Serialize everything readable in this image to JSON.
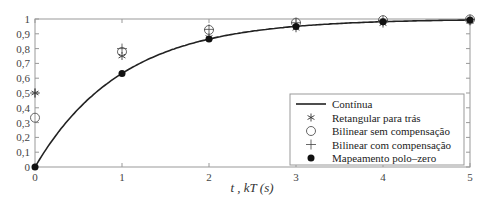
{
  "chart_data": {
    "type": "line",
    "title": "",
    "xlabel": "t , kT (s)",
    "ylabel": "",
    "xlim": [
      0,
      5
    ],
    "ylim": [
      0,
      1
    ],
    "xticks": [
      "0",
      "1",
      "2",
      "3",
      "4",
      "5"
    ],
    "yticks": [
      "0",
      "0,1",
      "0,2",
      "0,3",
      "0,4",
      "0,5",
      "0,6",
      "0,7",
      "0,8",
      "0,9",
      "1"
    ],
    "legend_position": "lower right",
    "x": [
      0,
      1,
      2,
      3,
      4,
      5
    ],
    "series": [
      {
        "name": "Contínua",
        "style": "line",
        "values": [
          0,
          0.632,
          0.865,
          0.95,
          0.982,
          0.993
        ]
      },
      {
        "name": "Retangular para trás",
        "style": "asterisk",
        "values": [
          0.5,
          0.75,
          0.875,
          0.9375,
          0.969,
          0.984
        ]
      },
      {
        "name": "Bilinear sem compensação",
        "style": "circle",
        "values": [
          0.333,
          0.778,
          0.926,
          0.975,
          0.992,
          0.997
        ]
      },
      {
        "name": "Bilinear com compensação",
        "style": "plus",
        "values": [
          0.5,
          0.8,
          0.93,
          0.975,
          0.99,
          0.997
        ]
      },
      {
        "name": "Mapeamento polo–zero",
        "style": "filled-circle",
        "values": [
          0,
          0.632,
          0.865,
          0.95,
          0.982,
          0.993
        ]
      }
    ]
  },
  "legend": {
    "items": [
      "Contínua",
      "Retangular para trás",
      "Bilinear sem compensação",
      "Bilinear com compensação",
      "Mapeamento polo–zero"
    ]
  },
  "axes": {
    "xlabel": "t , kT (s)"
  }
}
